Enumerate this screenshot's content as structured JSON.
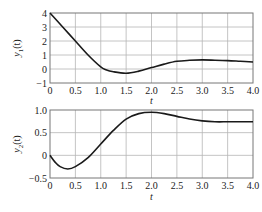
{
  "chart_data": [
    {
      "type": "line",
      "title": "",
      "xlabel": "t",
      "ylabel": "y1(t)",
      "ylabel_main": "y",
      "ylabel_sub": "1",
      "ylabel_arg": "(t)",
      "xlim": [
        0,
        4.0
      ],
      "ylim": [
        -1,
        4
      ],
      "grid": true,
      "x_ticks": [
        "0",
        "0.5",
        "1.0",
        "1.5",
        "2.0",
        "2.5",
        "3.0",
        "3.5",
        "4.0"
      ],
      "y_ticks": [
        "4",
        "3",
        "2",
        "1",
        "0",
        "−1"
      ],
      "x": [
        0,
        0.25,
        0.5,
        0.75,
        1.0,
        1.1,
        1.25,
        1.5,
        1.75,
        2.0,
        2.25,
        2.5,
        2.75,
        3.0,
        3.25,
        3.5,
        3.75,
        4.0
      ],
      "values": [
        4.0,
        3.0,
        2.0,
        1.0,
        0.15,
        -0.05,
        -0.2,
        -0.3,
        -0.15,
        0.1,
        0.35,
        0.55,
        0.62,
        0.65,
        0.63,
        0.6,
        0.55,
        0.5
      ]
    },
    {
      "type": "line",
      "title": "",
      "xlabel": "t",
      "ylabel": "y2(t)",
      "ylabel_main": "y",
      "ylabel_sub": "2",
      "ylabel_arg": "(t)",
      "xlim": [
        0,
        4.0
      ],
      "ylim": [
        -0.5,
        1.0
      ],
      "grid": true,
      "x_ticks": [
        "0",
        "0.5",
        "1.0",
        "1.5",
        "2.0",
        "2.5",
        "3.0",
        "3.5",
        "4.0"
      ],
      "y_ticks": [
        "1.0",
        "0.5",
        "0",
        "−0.5"
      ],
      "x": [
        0,
        0.1,
        0.2,
        0.35,
        0.5,
        0.75,
        1.0,
        1.25,
        1.5,
        1.75,
        2.0,
        2.25,
        2.5,
        2.75,
        3.0,
        3.25,
        3.5,
        3.75,
        4.0
      ],
      "values": [
        0.0,
        -0.15,
        -0.25,
        -0.3,
        -0.25,
        -0.05,
        0.25,
        0.55,
        0.8,
        0.92,
        0.95,
        0.92,
        0.86,
        0.8,
        0.76,
        0.74,
        0.74,
        0.74,
        0.74
      ]
    }
  ]
}
